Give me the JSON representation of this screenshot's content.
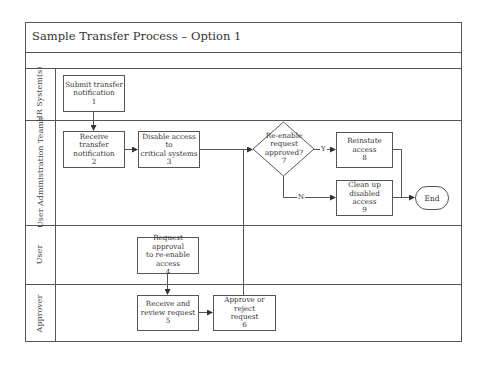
{
  "diagram": {
    "title": "Sample Transfer Process – Option 1",
    "lanes": [
      {
        "id": "hr",
        "label": "HR System(s)"
      },
      {
        "id": "uat",
        "label": "User Administration Teams"
      },
      {
        "id": "user",
        "label": "User"
      },
      {
        "id": "approver",
        "label": "Approver"
      }
    ],
    "steps": [
      {
        "id": 1,
        "lines": [
          "Submit transfer",
          "notification"
        ],
        "number": "1"
      },
      {
        "id": 2,
        "lines": [
          "Receive transfer",
          "notification"
        ],
        "number": "2"
      },
      {
        "id": 3,
        "lines": [
          "Disable access to",
          "critical systems"
        ],
        "number": "3"
      },
      {
        "id": 4,
        "lines": [
          "Request approval",
          "to re-enable",
          "access"
        ],
        "number": "4"
      },
      {
        "id": 5,
        "lines": [
          "Receive and",
          "review request"
        ],
        "number": "5"
      },
      {
        "id": 6,
        "lines": [
          "Approve or reject",
          "request"
        ],
        "number": "6"
      },
      {
        "id": 7,
        "lines": [
          "Re-enable",
          "request",
          "approved?"
        ],
        "number": "7",
        "type": "decision"
      },
      {
        "id": 8,
        "lines": [
          "Reinstate",
          "access"
        ],
        "number": "8"
      },
      {
        "id": 9,
        "lines": [
          "Clean up",
          "disabled access"
        ],
        "number": "9"
      }
    ],
    "end": {
      "label": "End"
    },
    "edge_labels": {
      "yes": "Y",
      "no": "N"
    },
    "colors": {
      "line": "#555555",
      "text": "#333333",
      "background": "#ffffff"
    }
  }
}
